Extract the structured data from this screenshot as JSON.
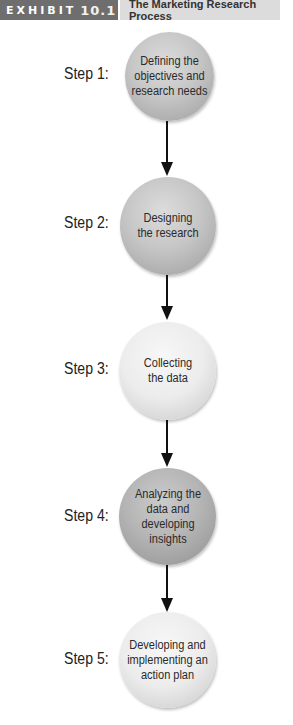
{
  "header": {
    "exhibit_label": "EXHIBIT",
    "exhibit_number": "10.1",
    "title": "The Marketing Research Process"
  },
  "steps": [
    {
      "label": "Step 1:",
      "text": "Defining the objectives and research needs"
    },
    {
      "label": "Step 2:",
      "text": "Designing the research"
    },
    {
      "label": "Step 3:",
      "text": "Collecting the data"
    },
    {
      "label": "Step 4:",
      "text": "Analyzing the data and developing insights"
    },
    {
      "label": "Step 5:",
      "text": "Developing and implementing an action plan"
    }
  ],
  "colors": {
    "exhibit_tag_bg": "#6e6e6e",
    "title_bg": "#dcdcdc",
    "arrow": "#111111"
  }
}
